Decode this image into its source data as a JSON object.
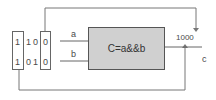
{
  "diagram": {
    "input_register": {
      "column1": [
        "1",
        "1"
      ],
      "middle_bits": [
        [
          "1",
          "0"
        ],
        [
          "0",
          "1"
        ]
      ],
      "column2": [
        "0",
        "0"
      ]
    },
    "inputs": {
      "a": "a",
      "b": "b"
    },
    "gate": {
      "expression": "C=a&&b",
      "fill_color": "#d0d0d0"
    },
    "output": {
      "label": "c",
      "register_value": "1000"
    },
    "colors": {
      "line": "#777777",
      "text": "#444444"
    }
  }
}
